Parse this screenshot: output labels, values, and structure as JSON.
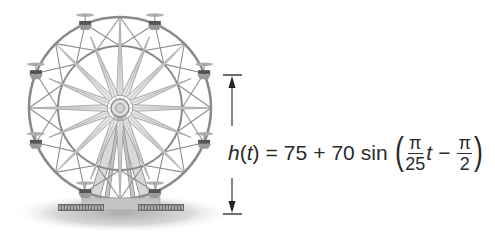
{
  "figure": {
    "wheel": {
      "center": [
        120,
        108
      ],
      "outer_radius": 91,
      "inner_radius": 62,
      "star_points": 16,
      "gondola_count": 8,
      "colors": {
        "frame": "#8a8a8a",
        "star_fill": "#d9d9d9",
        "star_stroke": "#9a9a9a",
        "ground": "#c8c8c8"
      }
    },
    "dimension_line": {
      "label": "h",
      "x": 232,
      "top_y": 75,
      "bottom_y": 214,
      "color": "#222222"
    },
    "formula": {
      "lhs_func": "h",
      "lhs_open": "(",
      "lhs_var": "t",
      "lhs_close": ")",
      "equals": "=",
      "midline": "75",
      "plus": "+",
      "amplitude": "70",
      "func": "sin",
      "open_paren": "(",
      "frac1_num": "π",
      "frac1_den": "25",
      "var": "t",
      "minus": "−",
      "frac2_num": "π",
      "frac2_den": "2",
      "close_paren": ")"
    }
  }
}
